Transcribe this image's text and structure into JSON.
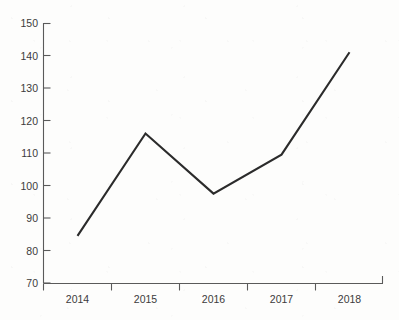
{
  "chart_data": {
    "type": "line",
    "title": "",
    "subtitle": "",
    "xlabel": "",
    "ylabel": "",
    "categories": [
      "2014",
      "2015",
      "2016",
      "2017",
      "2018"
    ],
    "values": [
      84.5,
      116,
      97.5,
      109.5,
      141
    ],
    "series": [
      {
        "name": "",
        "values": [
          84.5,
          116,
          97.5,
          109.5,
          141
        ]
      }
    ],
    "ylim": [
      70,
      150
    ],
    "y_ticks": [
      70,
      80,
      90,
      100,
      110,
      120,
      130,
      140,
      150
    ],
    "y_tick_labels": [
      "70",
      "80",
      "90",
      "100",
      "110",
      "120",
      "130",
      "140",
      "150"
    ],
    "x_tick_labels": [
      "2014",
      "2015",
      "2016",
      "2017",
      "2018"
    ],
    "grid": false,
    "legend": false,
    "legend_position": "none",
    "annotations": [],
    "colors": {
      "line": "#2b2b2b",
      "axis": "#5a5a5a",
      "tick_text": "#3b3b3b",
      "background": "#fdfdfc"
    }
  }
}
